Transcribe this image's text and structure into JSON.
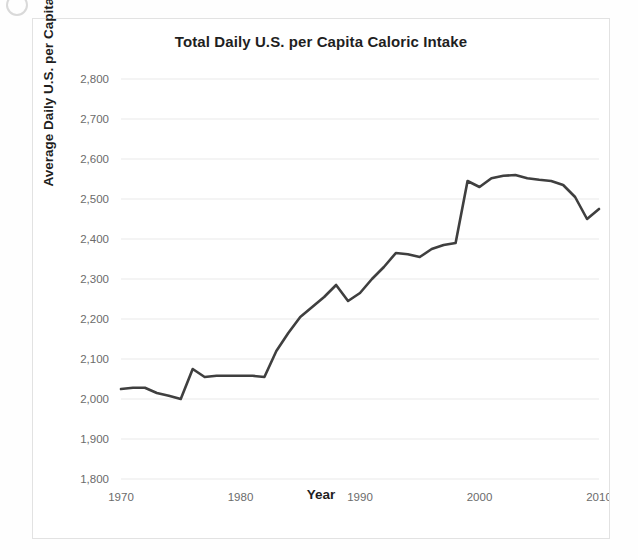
{
  "chart_data": {
    "type": "line",
    "title": "Total Daily U.S. per Capita Caloric Intake",
    "xlabel": "Year",
    "ylabel": "Average Daily U.S. per Capita Calorie Intake",
    "xlim": [
      1970,
      2010
    ],
    "ylim": [
      1800,
      2800
    ],
    "xticks": [
      1970,
      1980,
      1990,
      2000,
      2010
    ],
    "xtick_labels": [
      "1970",
      "1980",
      "1990",
      "2000",
      "2010"
    ],
    "yticks": [
      1800,
      1900,
      2000,
      2100,
      2200,
      2300,
      2400,
      2500,
      2600,
      2700,
      2800
    ],
    "ytick_labels": [
      "1,800",
      "1,900",
      "2,000",
      "2,100",
      "2,200",
      "2,300",
      "2,400",
      "2,500",
      "2,600",
      "2,700",
      "2,800"
    ],
    "grid": "horizontal",
    "legend": "none",
    "line_color": "#3f3f3f",
    "x": [
      1970,
      1971,
      1972,
      1973,
      1974,
      1975,
      1976,
      1977,
      1978,
      1979,
      1980,
      1981,
      1982,
      1983,
      1984,
      1985,
      1986,
      1987,
      1988,
      1989,
      1990,
      1991,
      1992,
      1993,
      1994,
      1995,
      1996,
      1997,
      1998,
      1999,
      2000,
      2001,
      2002,
      2003,
      2004,
      2005,
      2006,
      2007,
      2008,
      2009,
      2010
    ],
    "values": [
      2025,
      2028,
      2028,
      2015,
      2008,
      2000,
      2075,
      2055,
      2058,
      2058,
      2058,
      2058,
      2055,
      2120,
      2165,
      2205,
      2230,
      2255,
      2285,
      2245,
      2265,
      2300,
      2330,
      2365,
      2362,
      2355,
      2375,
      2385,
      2390,
      2545,
      2530,
      2552,
      2558,
      2560,
      2552,
      2548,
      2545,
      2535,
      2505,
      2450,
      2475
    ],
    "series_name": "Total daily U.S. per capita caloric intake"
  },
  "figure": {
    "title": "Total Daily U.S. per Capita Caloric Intake",
    "x_axis_title": "Year",
    "y_axis_title": "Average Daily U.S. per Capita Calorie Intake"
  }
}
